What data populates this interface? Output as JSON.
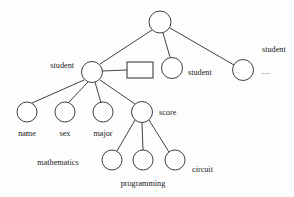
{
  "diagram": {
    "type": "tree",
    "background_color": "#fdfdfd",
    "stroke_color": "#2b2b2b",
    "text_color": "#1a1a1a",
    "nodes": [
      {
        "id": "root",
        "shape": "circle",
        "cx": 160,
        "cy": 22,
        "r": 11,
        "label": "",
        "label_x": 0,
        "label_y": 0,
        "label_anchor": "middle"
      },
      {
        "id": "student-1",
        "shape": "circle",
        "cx": 92,
        "cy": 72,
        "r": 10.5,
        "label": "student",
        "label_x": 74,
        "label_y": 68,
        "label_anchor": "end"
      },
      {
        "id": "unnamed-box",
        "shape": "rect",
        "x": 127,
        "y": 62,
        "w": 26,
        "h": 16,
        "label": "",
        "label_x": 0,
        "label_y": 0,
        "label_anchor": "middle"
      },
      {
        "id": "student-2",
        "shape": "circle",
        "cx": 172,
        "cy": 68,
        "r": 10.5,
        "label": "student",
        "label_x": 188,
        "label_y": 75,
        "label_anchor": "start"
      },
      {
        "id": "student-3",
        "shape": "circle",
        "cx": 243,
        "cy": 70,
        "r": 10.5,
        "label": "student",
        "label_x": 262,
        "label_y": 52,
        "label_anchor": "start"
      },
      {
        "id": "name",
        "shape": "circle",
        "cx": 27,
        "cy": 112,
        "r": 10,
        "label": "name",
        "label_x": 27,
        "label_y": 136,
        "label_anchor": "middle"
      },
      {
        "id": "sex",
        "shape": "circle",
        "cx": 65,
        "cy": 112,
        "r": 10,
        "label": "sex",
        "label_x": 65,
        "label_y": 136,
        "label_anchor": "middle"
      },
      {
        "id": "major",
        "shape": "circle",
        "cx": 103,
        "cy": 112,
        "r": 10,
        "label": "major",
        "label_x": 103,
        "label_y": 136,
        "label_anchor": "middle"
      },
      {
        "id": "score",
        "shape": "circle",
        "cx": 142,
        "cy": 112,
        "r": 10.5,
        "label": "score",
        "label_x": 159,
        "label_y": 115,
        "label_anchor": "start"
      },
      {
        "id": "mathematics",
        "shape": "circle",
        "cx": 112,
        "cy": 160,
        "r": 10,
        "label": "mathematics",
        "label_x": 58,
        "label_y": 165,
        "label_anchor": "middle"
      },
      {
        "id": "programming",
        "shape": "circle",
        "cx": 143,
        "cy": 160,
        "r": 10,
        "label": "programming",
        "label_x": 143,
        "label_y": 186,
        "label_anchor": "middle"
      },
      {
        "id": "circuit",
        "shape": "circle",
        "cx": 175,
        "cy": 160,
        "r": 10,
        "label": "circuit",
        "label_x": 192,
        "label_y": 172,
        "label_anchor": "start"
      }
    ],
    "ellipsis": {
      "text": "...",
      "x": 262,
      "y": 74
    },
    "edges": [
      {
        "from": "root",
        "to": "student-1",
        "x1": 152,
        "y1": 30,
        "x2": 100,
        "y2": 64
      },
      {
        "from": "root",
        "to": "student-2",
        "x1": 163,
        "y1": 33,
        "x2": 170,
        "y2": 57
      },
      {
        "from": "root",
        "to": "student-3",
        "x1": 170,
        "y1": 28,
        "x2": 234,
        "y2": 65
      },
      {
        "from": "student-1",
        "to": "unnamed-box",
        "x1": 102,
        "y1": 71,
        "x2": 127,
        "y2": 70
      },
      {
        "from": "student-1",
        "to": "name",
        "x1": 84,
        "y1": 80,
        "x2": 32,
        "y2": 103
      },
      {
        "from": "student-1",
        "to": "sex",
        "x1": 88,
        "y1": 82,
        "x2": 68,
        "y2": 103
      },
      {
        "from": "student-1",
        "to": "major",
        "x1": 95,
        "y1": 82,
        "x2": 101,
        "y2": 103
      },
      {
        "from": "student-1",
        "to": "score",
        "x1": 100,
        "y1": 80,
        "x2": 135,
        "y2": 104
      },
      {
        "from": "score",
        "to": "mathematics",
        "x1": 135,
        "y1": 120,
        "x2": 117,
        "y2": 151
      },
      {
        "from": "score",
        "to": "programming",
        "x1": 142,
        "y1": 123,
        "x2": 143,
        "y2": 150
      },
      {
        "from": "score",
        "to": "circuit",
        "x1": 149,
        "y1": 120,
        "x2": 169,
        "y2": 152
      }
    ]
  }
}
